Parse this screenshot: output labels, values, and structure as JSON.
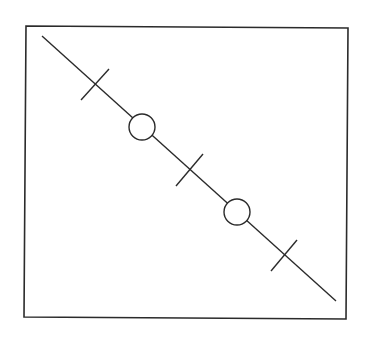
{
  "diagram": {
    "stroke_color": "#2b2b2b",
    "background": "#ffffff",
    "frame": {
      "points": [
        [
          26,
          26
        ],
        [
          348,
          28
        ],
        [
          346,
          319
        ],
        [
          24,
          317
        ]
      ],
      "stroke_width": 1.6
    },
    "main_line": {
      "from": [
        42,
        36
      ],
      "to": [
        336,
        301
      ],
      "stroke_width": 1.4
    },
    "tick_marks": [
      {
        "center": [
          95,
          84
        ],
        "from": [
          81,
          100
        ],
        "to": [
          109,
          69
        ]
      },
      {
        "center": [
          189,
          170
        ],
        "from": [
          176,
          186
        ],
        "to": [
          203,
          154
        ]
      },
      {
        "center": [
          284,
          255
        ],
        "from": [
          271,
          271
        ],
        "to": [
          297,
          240
        ]
      }
    ],
    "circles": [
      {
        "center": [
          142,
          127
        ],
        "radius": 13
      },
      {
        "center": [
          237,
          212
        ],
        "radius": 13
      }
    ]
  }
}
